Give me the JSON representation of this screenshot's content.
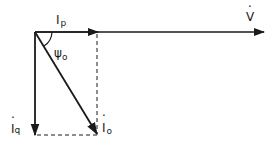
{
  "diagram": {
    "type": "phasor diagram",
    "labels": {
      "ip_main": "I",
      "ip_sub": "p",
      "v": "V",
      "v_dot": "·",
      "psi_main": "ψ",
      "psi_sub": "o",
      "iq_main": "I",
      "iq_sub": "q",
      "iq_dot": "·",
      "io_main": "I",
      "io_sub": "o",
      "io_dot": "·"
    },
    "colors": {
      "stroke": "#1a1a1a",
      "background": "#ffffff"
    }
  }
}
